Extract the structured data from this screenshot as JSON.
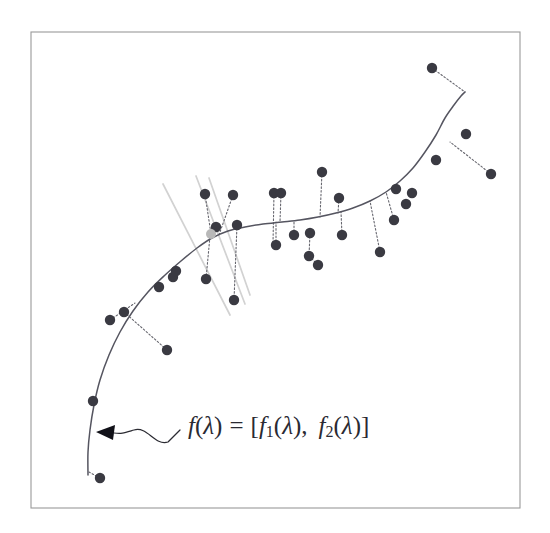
{
  "figure": {
    "background_color": "#ffffff",
    "frame": {
      "x": 31,
      "y": 32,
      "width": 489,
      "height": 476,
      "stroke_color": "#9a9a9a"
    },
    "annotation": {
      "formula_parts": {
        "f": "f",
        "open_paren": "(",
        "lambda": "λ",
        "close_paren": ")",
        "equals": "=",
        "open_bracket": "[",
        "f1": "f",
        "sub1": "1",
        "comma": ",",
        "f2": "f",
        "sub2": "2",
        "close_bracket": "]"
      },
      "formula_label": "f(λ) = [f₁(λ),  f₂(λ)]",
      "leader_description": "wavy-leader-with-arrowhead-pointing-to-curve",
      "arrow_tip": {
        "x": 96,
        "y": 432
      },
      "text_anchor": {
        "x": 188,
        "y": 428
      }
    },
    "colors": {
      "curve": "#555560",
      "data_point": "#3a3a42",
      "projection": "#66666e",
      "neighborhood": "#d2d2d2",
      "highlight_point": "#b8b8b8",
      "frame": "#9a9a9a",
      "text": "#2a2a32"
    }
  },
  "chart_data": {
    "type": "scatter",
    "title": "",
    "subtitle": "",
    "xlabel": "",
    "ylabel": "",
    "xlim": [
      31,
      520
    ],
    "ylim": [
      32,
      508
    ],
    "grid": false,
    "legend": null,
    "axis_ticks": {
      "x": [],
      "y": []
    },
    "annotations": [
      {
        "text": "f(λ) = [f₁(λ),  f₂(λ)]",
        "x": 188,
        "y": 428,
        "points_to": {
          "x": 96,
          "y": 432
        }
      }
    ],
    "series": [
      {
        "name": "principal-curve",
        "type": "line",
        "style": "solid",
        "color": "#555560",
        "path_points": [
          [
            88,
            475
          ],
          [
            88,
            452
          ],
          [
            90,
            430
          ],
          [
            94,
            405
          ],
          [
            100,
            380
          ],
          [
            109,
            355
          ],
          [
            120,
            332
          ],
          [
            133,
            311
          ],
          [
            148,
            292
          ],
          [
            164,
            276
          ],
          [
            181,
            261
          ],
          [
            197,
            248
          ],
          [
            212,
            238
          ],
          [
            228,
            231
          ],
          [
            245,
            227
          ],
          [
            263,
            224
          ],
          [
            282,
            222
          ],
          [
            300,
            220
          ],
          [
            318,
            217
          ],
          [
            336,
            213
          ],
          [
            353,
            208
          ],
          [
            370,
            201
          ],
          [
            386,
            192
          ],
          [
            400,
            181
          ],
          [
            413,
            168
          ],
          [
            425,
            152
          ],
          [
            436,
            135
          ],
          [
            445,
            118
          ],
          [
            454,
            105
          ],
          [
            461,
            96
          ],
          [
            465,
            92
          ]
        ]
      },
      {
        "name": "data-points",
        "type": "scatter",
        "color": "#3a3a42",
        "marker_radius": 5.2,
        "points": [
          [
            100,
            478
          ],
          [
            93,
            401
          ],
          [
            110,
            320
          ],
          [
            124,
            312
          ],
          [
            167,
            350
          ],
          [
            159,
            287
          ],
          [
            173,
            277
          ],
          [
            176,
            271
          ],
          [
            206,
            279
          ],
          [
            205,
            194
          ],
          [
            216,
            227
          ],
          [
            234,
            300
          ],
          [
            233,
            195
          ],
          [
            237,
            225
          ],
          [
            274,
            193
          ],
          [
            281,
            193
          ],
          [
            276,
            245
          ],
          [
            294,
            235
          ],
          [
            310,
            233
          ],
          [
            309,
            256
          ],
          [
            318,
            265
          ],
          [
            322,
            172
          ],
          [
            339,
            198
          ],
          [
            342,
            235
          ],
          [
            380,
            252
          ],
          [
            394,
            220
          ],
          [
            396,
            189
          ],
          [
            406,
            204
          ],
          [
            412,
            193
          ],
          [
            432,
            68
          ],
          [
            436,
            160
          ],
          [
            466,
            134
          ],
          [
            491,
            174
          ]
        ]
      },
      {
        "name": "projection-segments",
        "type": "line",
        "style": "dotted",
        "color": "#66666e",
        "segments": [
          [
            [
              100,
              478
            ],
            [
              89,
              472
            ]
          ],
          [
            [
              93,
              401
            ],
            [
              96,
              400
            ]
          ],
          [
            [
              110,
              320
            ],
            [
              135,
              303
            ]
          ],
          [
            [
              124,
              312
            ],
            [
              167,
              350
            ]
          ],
          [
            [
              176,
              271
            ],
            [
              176,
              267
            ]
          ],
          [
            [
              205,
              194
            ],
            [
              211,
              234
            ]
          ],
          [
            [
              216,
              227
            ],
            [
              213,
              236
            ]
          ],
          [
            [
              206,
              279
            ],
            [
              210,
              236
            ]
          ],
          [
            [
              233,
              195
            ],
            [
              219,
              235
            ]
          ],
          [
            [
              237,
              225
            ],
            [
              234,
              300
            ]
          ],
          [
            [
              274,
              193
            ],
            [
              273,
              243
            ]
          ],
          [
            [
              281,
              193
            ],
            [
              280,
              222
            ]
          ],
          [
            [
              276,
              245
            ],
            [
              276,
              222
            ]
          ],
          [
            [
              294,
              235
            ],
            [
              294,
              221
            ]
          ],
          [
            [
              310,
              233
            ],
            [
              309,
              256
            ]
          ],
          [
            [
              309,
              256
            ],
            [
              318,
              265
            ]
          ],
          [
            [
              322,
              172
            ],
            [
              320,
              217
            ]
          ],
          [
            [
              339,
              198
            ],
            [
              338,
              213
            ]
          ],
          [
            [
              342,
              235
            ],
            [
              341,
              212
            ]
          ],
          [
            [
              380,
              252
            ],
            [
              370,
              201
            ]
          ],
          [
            [
              394,
              220
            ],
            [
              386,
              192
            ]
          ],
          [
            [
              412,
              193
            ],
            [
              409,
              190
            ]
          ],
          [
            [
              432,
              68
            ],
            [
              465,
              92
            ]
          ],
          [
            [
              491,
              174
            ],
            [
              450,
              142
            ]
          ],
          [
            [
              436,
              160
            ],
            [
              439,
              158
            ]
          ]
        ]
      },
      {
        "name": "neighborhood-boundary-lines",
        "type": "line",
        "style": "solid-light",
        "color": "#d2d2d2",
        "segments": [
          [
            [
              163,
              184
            ],
            [
              230,
              315
            ]
          ],
          [
            [
              196,
              176
            ],
            [
              245,
              304
            ]
          ],
          [
            [
              209,
              178
            ],
            [
              250,
              295
            ]
          ]
        ]
      },
      {
        "name": "curve-point-highlight",
        "type": "scatter",
        "color": "#b8b8b8",
        "marker_radius": 5.0,
        "points": [
          [
            211,
            234
          ]
        ]
      }
    ]
  }
}
